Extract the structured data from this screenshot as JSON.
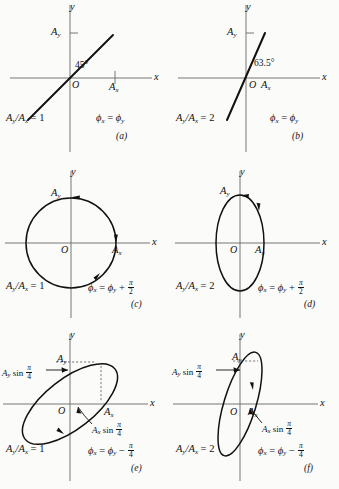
{
  "figure": {
    "kind": "lissajous-polarization-figure",
    "background_color": "#fbfbfa",
    "stroke_color": "#111111",
    "axis_color": "#555555",
    "panel_count": 6
  },
  "symbols": {
    "A": "A",
    "sub_x": "x",
    "sub_y": "y",
    "phi": "ϕ",
    "pi": "π",
    "equals": "=",
    "plus": "+",
    "minus": "−",
    "degree": "°",
    "slash": "/",
    "sin": "sin",
    "origin": "O",
    "axis_x": "x",
    "axis_y": "y"
  },
  "panels": [
    {
      "id": "a",
      "caption": "(a)",
      "curve_type": "line",
      "angle_label": "45°",
      "has_angle_label": true,
      "axis_x_label": "x",
      "axis_y_label": "y",
      "origin_label": "O",
      "amp_x_label": "A",
      "amp_x_sub": "x",
      "amp_y_label": "A",
      "amp_y_sub": "y",
      "ratio_text": "A",
      "ratio_sub_1": "y",
      "ratio_mid": "/A",
      "ratio_sub_2": "x",
      "ratio_value": " = 1",
      "phase_lhs": "ϕ",
      "phase_lhs_sub": "x",
      "phase_op": " = ",
      "phase_rhs": "ϕ",
      "phase_rhs_sub": "y",
      "phase_extra": "",
      "phase_frac_num": "",
      "phase_frac_den": "",
      "annotations": []
    },
    {
      "id": "b",
      "caption": "(b)",
      "curve_type": "line",
      "angle_label": "63.5°",
      "has_angle_label": true,
      "axis_x_label": "x",
      "axis_y_label": "y",
      "origin_label": "O",
      "amp_x_label": "A",
      "amp_x_sub": "x",
      "amp_y_label": "A",
      "amp_y_sub": "y",
      "ratio_text": "A",
      "ratio_sub_1": "y",
      "ratio_mid": "/A",
      "ratio_sub_2": "x",
      "ratio_value": " = 2",
      "phase_lhs": "ϕ",
      "phase_lhs_sub": "x",
      "phase_op": " = ",
      "phase_rhs": "ϕ",
      "phase_rhs_sub": "y",
      "phase_extra": "",
      "phase_frac_num": "",
      "phase_frac_den": "",
      "annotations": []
    },
    {
      "id": "c",
      "caption": "(c)",
      "curve_type": "circle",
      "angle_label": "",
      "has_angle_label": false,
      "axis_x_label": "x",
      "axis_y_label": "y",
      "origin_label": "O",
      "amp_x_label": "A",
      "amp_x_sub": "x",
      "amp_y_label": "A",
      "amp_y_sub": "y",
      "ratio_text": "A",
      "ratio_sub_1": "y",
      "ratio_mid": "/A",
      "ratio_sub_2": "x",
      "ratio_value": " = 1",
      "phase_lhs": "ϕ",
      "phase_lhs_sub": "x",
      "phase_op": " = ",
      "phase_rhs": "ϕ",
      "phase_rhs_sub": "y",
      "phase_extra": " + ",
      "phase_frac_num": "π",
      "phase_frac_den": "2",
      "annotations": []
    },
    {
      "id": "d",
      "caption": "(d)",
      "curve_type": "ellipse-vertical",
      "angle_label": "",
      "has_angle_label": false,
      "axis_x_label": "x",
      "axis_y_label": "y",
      "origin_label": "O",
      "amp_x_label": "A",
      "amp_x_sub": "x",
      "amp_y_label": "A",
      "amp_y_sub": "y",
      "ratio_text": "A",
      "ratio_sub_1": "y",
      "ratio_mid": "/A",
      "ratio_sub_2": "x",
      "ratio_value": " = 2",
      "phase_lhs": "ϕ",
      "phase_lhs_sub": "x",
      "phase_op": " = ",
      "phase_rhs": "ϕ",
      "phase_rhs_sub": "y",
      "phase_extra": " + ",
      "phase_frac_num": "π",
      "phase_frac_den": "2",
      "annotations": []
    },
    {
      "id": "e",
      "caption": "(e)",
      "curve_type": "ellipse-tilted-wide",
      "angle_label": "",
      "has_angle_label": false,
      "axis_x_label": "x",
      "axis_y_label": "y",
      "origin_label": "O",
      "amp_x_label": "A",
      "amp_x_sub": "x",
      "amp_y_label": "A",
      "amp_y_sub": "y",
      "ratio_text": "A",
      "ratio_sub_1": "y",
      "ratio_mid": "/A",
      "ratio_sub_2": "x",
      "ratio_value": " = 1",
      "phase_lhs": "ϕ",
      "phase_lhs_sub": "x",
      "phase_op": " = ",
      "phase_rhs": "ϕ",
      "phase_rhs_sub": "y",
      "phase_extra": " − ",
      "phase_frac_num": "π",
      "phase_frac_den": "4",
      "annotations": [
        {
          "name": "ay-sin-annotation",
          "prefix": "A",
          "sub": "y",
          "func": " sin ",
          "frac_num": "π",
          "frac_den": "4"
        },
        {
          "name": "ax-sin-annotation",
          "prefix": "A",
          "sub": "x",
          "func": " sin ",
          "frac_num": "π",
          "frac_den": "4"
        }
      ]
    },
    {
      "id": "f",
      "caption": "(f)",
      "curve_type": "ellipse-tilted-narrow",
      "angle_label": "",
      "has_angle_label": false,
      "axis_x_label": "x",
      "axis_y_label": "y",
      "origin_label": "O",
      "amp_x_label": "A",
      "amp_x_sub": "x",
      "amp_y_label": "A",
      "amp_y_sub": "y",
      "ratio_text": "A",
      "ratio_sub_1": "y",
      "ratio_mid": "/A",
      "ratio_sub_2": "x",
      "ratio_value": " = 2",
      "phase_lhs": "ϕ",
      "phase_lhs_sub": "x",
      "phase_op": " = ",
      "phase_rhs": "ϕ",
      "phase_rhs_sub": "y",
      "phase_extra": " − ",
      "phase_frac_num": "π",
      "phase_frac_den": "4",
      "annotations": [
        {
          "name": "ay-sin-annotation",
          "prefix": "A",
          "sub": "y",
          "func": " sin ",
          "frac_num": "π",
          "frac_den": "4"
        },
        {
          "name": "ax-sin-annotation",
          "prefix": "A",
          "sub": "x",
          "func": " sin ",
          "frac_num": "π",
          "frac_den": "4"
        }
      ]
    }
  ]
}
